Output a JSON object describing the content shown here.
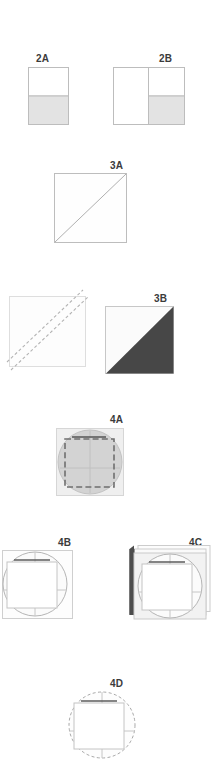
{
  "document": {
    "kind": "patent-style-figure-sheet",
    "background_color": "#ffffff",
    "width": 217,
    "height": 766
  },
  "palette": {
    "label_text": "#3b3b3b",
    "outline": "#b9b9b9",
    "outline_dark": "#8d8d8d",
    "fill_white": "#ffffff",
    "fill_light_gray": "#e3e3e3",
    "fill_mid_gray": "#cfcfcf",
    "fill_dark_gray": "#4a4a4a",
    "fill_darker_gray": "#3f3f3f",
    "dash_gray": "#9a9a9a"
  },
  "figures": [
    {
      "id": "fig-2a",
      "label": "2A",
      "label_x": 36,
      "label_y": 53,
      "shape": "rectangle-half-filled",
      "description": "Vertical rectangle, upper half white, lower half light gray",
      "panel_x": 28,
      "panel_y": 67,
      "panel_w": 41,
      "panel_h": 58,
      "split_ratio": 0.5
    },
    {
      "id": "fig-2b",
      "label": "2B",
      "label_x": 159,
      "label_y": 53,
      "shape": "square-split-vertical-half-filled",
      "description": "Square divided vertically; left half white; right half white top and light gray bottom",
      "panel_x": 113,
      "panel_y": 67,
      "panel_w": 72,
      "panel_h": 58,
      "split_ratio": 0.5
    },
    {
      "id": "fig-3a",
      "label": "3A",
      "label_x": 110,
      "label_y": 160,
      "shape": "square-with-diagonal",
      "description": "White square with a thin diagonal line from bottom-left to top-right",
      "panel_x": 54,
      "panel_y": 173,
      "panel_w": 73,
      "panel_h": 70
    },
    {
      "id": "fig-3b-left",
      "label": "",
      "shape": "square-with-two-dashed-diagonals",
      "description": "White square with two parallel dashed diagonal lines running lower-left to upper-right",
      "panel_x": 9,
      "panel_y": 296,
      "panel_w": 77,
      "panel_h": 71
    },
    {
      "id": "fig-3b",
      "label": "3B",
      "label_x": 154,
      "label_y": 293,
      "shape": "square-lower-right-triangle-filled",
      "description": "Square with lower-right triangle filled dark gray, upper-left triangle white",
      "panel_x": 105,
      "panel_y": 306,
      "panel_w": 69,
      "panel_h": 68
    },
    {
      "id": "fig-4a",
      "label": "4A",
      "label_x": 110,
      "label_y": 414,
      "shape": "square-with-gray-disc-and-dashed-square",
      "description": "Light gray square containing a gray circle, a dashed square outline and faint cross lines",
      "panel_x": 56,
      "panel_y": 428,
      "panel_w": 68,
      "panel_h": 68
    },
    {
      "id": "fig-4b",
      "label": "4B",
      "label_x": 58,
      "label_y": 537,
      "shape": "square-with-circle-and-inner-white-square",
      "description": "Light square with an outlined circle and an inner white square plus a dark top bar",
      "panel_x": 2,
      "panel_y": 550,
      "panel_w": 71,
      "panel_h": 69
    },
    {
      "id": "fig-4c",
      "label": "4C",
      "label_x": 189,
      "label_y": 537,
      "shape": "stacked-sheets-with-circle-and-inner-square",
      "description": "Stacked layered sheets with a dark spine on the left, circle outline and inner white square",
      "panel_x": 129,
      "panel_y": 545,
      "panel_w": 88,
      "panel_h": 77
    },
    {
      "id": "fig-4d",
      "label": "4D",
      "label_x": 110,
      "label_y": 678,
      "shape": "dashed-circle-with-inner-square",
      "description": "Dashed-outline circle containing a square and a dark top bar",
      "panel_x": 67,
      "panel_y": 690,
      "panel_w": 70,
      "panel_h": 70
    }
  ]
}
